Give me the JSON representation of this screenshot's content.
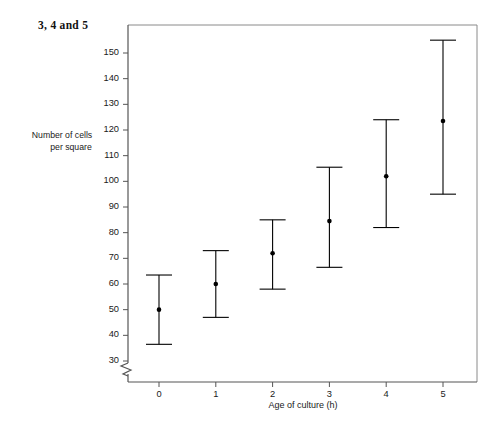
{
  "figure": {
    "title": "3, 4 and 5"
  },
  "axes": {
    "y_label_line1": "Number of cells",
    "y_label_line2": "per square",
    "x_label": "Age of culture (h)",
    "y_ticks": [
      "30",
      "40",
      "50",
      "60",
      "70",
      "80",
      "90",
      "100",
      "110",
      "120",
      "130",
      "140",
      "150"
    ],
    "x_ticks": [
      "0",
      "1",
      "2",
      "3",
      "4",
      "5"
    ],
    "axis_break_symbol": "zigzag-break"
  },
  "chart_data": {
    "type": "scatter",
    "title": "3, 4 and 5",
    "xlabel": "Age of culture (h)",
    "ylabel": "Number of cells per square",
    "xlim": [
      -0.55,
      5.55
    ],
    "ylim": [
      28,
      158
    ],
    "ylim_broken_below": 30,
    "grid": false,
    "legend": null,
    "x": [
      0,
      1,
      2,
      3,
      4,
      5
    ],
    "values": [
      50,
      60,
      72,
      84.5,
      102,
      123.5
    ],
    "error_upper": [
      63.5,
      73,
      85,
      105.5,
      124,
      155
    ],
    "error_lower": [
      36.5,
      47,
      58,
      66.5,
      82,
      95
    ],
    "categories": [
      "0",
      "1",
      "2",
      "3",
      "4",
      "5"
    ],
    "marker": "filled-circle",
    "marker_color": "#000000",
    "line_color": "#000000",
    "series": [
      {
        "name": "Number of cells per square",
        "values": [
          50,
          60,
          72,
          84.5,
          102,
          123.5
        ],
        "error_upper": [
          63.5,
          73,
          85,
          105.5,
          124,
          155
        ],
        "error_lower": [
          36.5,
          47,
          58,
          66.5,
          82,
          95
        ]
      }
    ]
  },
  "colors": {
    "axis": "#444444",
    "frame": "#777777",
    "marker": "#000000",
    "background": "#ffffff"
  }
}
